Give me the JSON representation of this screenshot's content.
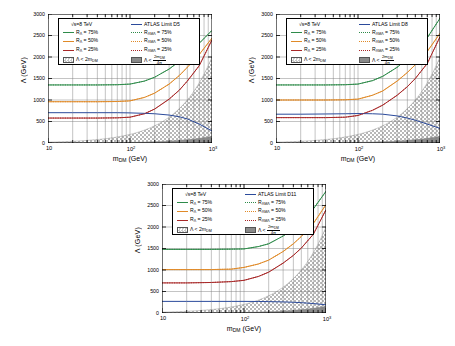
{
  "figure": {
    "axis": {
      "ylabel": "Λ (GeV)",
      "xlabel_main": "m",
      "xlabel_sub": "DM",
      "xlabel_unit": " (GeV)",
      "yticks": [
        "0",
        "500",
        "1000",
        "1500",
        "2000",
        "2500",
        "3000"
      ],
      "ytick_values": [
        0,
        500,
        1000,
        1500,
        2000,
        2500,
        3000
      ],
      "xticks": [
        "10",
        "10",
        "10"
      ],
      "xtick_exponents": [
        "",
        "2",
        "3"
      ],
      "xtick_values": [
        10,
        100,
        1000
      ],
      "ylim": [
        0,
        3000
      ],
      "xlim": [
        10,
        1000
      ],
      "xscale": "log",
      "grid": true
    },
    "legend_common": {
      "energy": "√s=8 TeV",
      "rows": [
        {
          "left_label": "R",
          "left_sub": "Λ",
          "left_value": " = 75%",
          "left_color": "#2e8b4a",
          "left_style": "solid",
          "right_label": "R",
          "right_sub": "ΛMΛ",
          "right_value": " = 75%",
          "right_color": "#2e8b4a",
          "right_style": "dotted"
        },
        {
          "left_label": "R",
          "left_sub": "Λ",
          "left_value": " = 50%",
          "left_color": "#e08a28",
          "left_style": "solid",
          "right_label": "R",
          "right_sub": "ΛMΛ",
          "right_value": " = 50%",
          "right_color": "#e08a28",
          "right_style": "dotted"
        },
        {
          "left_label": "R",
          "left_sub": "Λ",
          "left_value": " = 25%",
          "left_color": "#a82828",
          "left_style": "solid",
          "right_label": "R",
          "right_sub": "ΛMΛ",
          "right_value": " = 25%",
          "right_color": "#a82828",
          "right_style": "dotted"
        }
      ],
      "hatch_light_label_pre": "Λ < 2m",
      "hatch_light_label_sub": "DM",
      "hatch_dark_label_pre": "Λ < ",
      "hatch_dark_num_pre": "2m",
      "hatch_dark_num_sub": "DM",
      "hatch_dark_den": "4π",
      "atlas_color": "#2b4a9b"
    },
    "colors": {
      "green": "#2e8b4a",
      "orange": "#e08a28",
      "red": "#a82828",
      "blue": "#2b4a9b",
      "hatch_light": "#b8b8b8",
      "hatch_dark": "#8a8a8a",
      "axis": "#000000",
      "grid": "#7a7a7a"
    },
    "panels": [
      {
        "id": "panel-d5",
        "atlas_label": "ATLAS Limit D5",
        "position": {
          "left": 18,
          "top": 8,
          "width": 200,
          "height": 165
        }
      },
      {
        "id": "panel-d8",
        "atlas_label": "ATLAS Limit D8",
        "position": {
          "left": 246,
          "top": 8,
          "width": 200,
          "height": 165
        }
      },
      {
        "id": "panel-d11",
        "atlas_label": "ATLAS Limit D11",
        "position": {
          "left": 132,
          "top": 178,
          "width": 200,
          "height": 165
        }
      }
    ]
  },
  "chart_data": [
    {
      "type": "line",
      "title": "ATLAS Limit D5",
      "subtitle": "√s=8 TeV",
      "xlabel": "m_DM (GeV)",
      "ylabel": "Λ (GeV)",
      "xscale": "log",
      "xlim": [
        10,
        1000
      ],
      "ylim": [
        0,
        3000
      ],
      "grid": true,
      "legend_position": "top-left-inside",
      "x": [
        10,
        20,
        40,
        70,
        100,
        150,
        200,
        300,
        400,
        500,
        700,
        1000
      ],
      "series": [
        {
          "name": "R_Λ = 75%",
          "color": "#2e8b4a",
          "style": "solid",
          "values": [
            1350,
            1350,
            1350,
            1355,
            1370,
            1440,
            1530,
            1720,
            1900,
            2060,
            2320,
            2620
          ]
        },
        {
          "name": "R_Λ = 50%",
          "color": "#e08a28",
          "style": "solid",
          "values": [
            960,
            960,
            960,
            965,
            980,
            1060,
            1160,
            1370,
            1570,
            1760,
            2060,
            2440
          ]
        },
        {
          "name": "R_Λ = 25%",
          "color": "#a82828",
          "style": "solid",
          "values": [
            580,
            580,
            580,
            585,
            600,
            680,
            790,
            1020,
            1230,
            1440,
            1800,
            2400
          ]
        },
        {
          "name": "ATLAS Limit D5",
          "color": "#2b4a9b",
          "style": "solid",
          "values": [
            705,
            705,
            705,
            705,
            700,
            690,
            680,
            650,
            610,
            560,
            440,
            280
          ]
        },
        {
          "name": "R_ΛMΛ = 75%",
          "color": "#2e8b4a",
          "style": "dotted",
          "values": [
            1350,
            1350,
            1350,
            1355,
            1370,
            1440,
            1530,
            1720,
            1900,
            2060,
            2320,
            2620
          ]
        },
        {
          "name": "R_ΛMΛ = 50%",
          "color": "#e08a28",
          "style": "dotted",
          "values": [
            960,
            960,
            960,
            965,
            980,
            1060,
            1160,
            1370,
            1570,
            1760,
            2060,
            2440
          ]
        },
        {
          "name": "R_ΛMΛ = 25%",
          "color": "#a82828",
          "style": "dotted",
          "values": [
            580,
            580,
            580,
            585,
            600,
            680,
            790,
            1020,
            1230,
            1440,
            1800,
            2400
          ]
        }
      ],
      "regions": [
        {
          "name": "Λ < 2m_DM",
          "fill": "checker-light",
          "x": [
            10,
            1000
          ],
          "y_upper": [
            20,
            2000
          ]
        },
        {
          "name": "Λ < 2m_DM/4π",
          "fill": "solid-gray",
          "x": [
            10,
            1000
          ],
          "y_upper": [
            2,
            160
          ]
        }
      ]
    },
    {
      "type": "line",
      "title": "ATLAS Limit D8",
      "subtitle": "√s=8 TeV",
      "xlabel": "m_DM (GeV)",
      "ylabel": "Λ (GeV)",
      "xscale": "log",
      "xlim": [
        10,
        1000
      ],
      "ylim": [
        0,
        3000
      ],
      "grid": true,
      "legend_position": "top-left-inside",
      "x": [
        10,
        20,
        40,
        70,
        100,
        150,
        200,
        300,
        400,
        500,
        700,
        1000
      ],
      "series": [
        {
          "name": "R_Λ = 75%",
          "color": "#2e8b4a",
          "style": "solid",
          "values": [
            1350,
            1350,
            1350,
            1355,
            1370,
            1450,
            1550,
            1760,
            1960,
            2130,
            2450,
            2900
          ]
        },
        {
          "name": "R_Λ = 50%",
          "color": "#e08a28",
          "style": "solid",
          "values": [
            1000,
            1000,
            1000,
            1005,
            1020,
            1110,
            1210,
            1440,
            1640,
            1820,
            2130,
            2550
          ]
        },
        {
          "name": "R_Λ = 25%",
          "color": "#a82828",
          "style": "solid",
          "values": [
            590,
            590,
            590,
            600,
            640,
            760,
            880,
            1110,
            1310,
            1500,
            1850,
            2470
          ]
        },
        {
          "name": "ATLAS Limit D8",
          "color": "#2b4a9b",
          "style": "solid",
          "values": [
            670,
            670,
            675,
            680,
            685,
            680,
            670,
            630,
            580,
            530,
            440,
            340
          ]
        },
        {
          "name": "R_ΛMΛ = 75%",
          "color": "#2e8b4a",
          "style": "dotted",
          "values": [
            1350,
            1350,
            1350,
            1355,
            1370,
            1450,
            1550,
            1760,
            1960,
            2130,
            2450,
            2900
          ]
        },
        {
          "name": "R_ΛMΛ = 50%",
          "color": "#e08a28",
          "style": "dotted",
          "values": [
            1000,
            1000,
            1000,
            1005,
            1020,
            1110,
            1210,
            1440,
            1640,
            1820,
            2130,
            2550
          ]
        },
        {
          "name": "R_ΛMΛ = 25%",
          "color": "#a82828",
          "style": "dotted",
          "values": [
            590,
            590,
            590,
            600,
            640,
            760,
            880,
            1110,
            1310,
            1500,
            1850,
            2470
          ]
        }
      ],
      "regions": [
        {
          "name": "Λ < 2m_DM",
          "fill": "checker-light",
          "x": [
            10,
            1000
          ],
          "y_upper": [
            20,
            2000
          ]
        },
        {
          "name": "Λ < 2m_DM/4π",
          "fill": "solid-gray",
          "x": [
            10,
            1000
          ],
          "y_upper": [
            2,
            160
          ]
        }
      ]
    },
    {
      "type": "line",
      "title": "ATLAS Limit D11",
      "subtitle": "√s=8 TeV",
      "xlabel": "m_DM (GeV)",
      "ylabel": "Λ (GeV)",
      "xscale": "log",
      "xlim": [
        10,
        1000
      ],
      "ylim": [
        0,
        3000
      ],
      "grid": true,
      "legend_position": "top-left-inside",
      "x": [
        10,
        20,
        40,
        70,
        100,
        150,
        200,
        300,
        400,
        500,
        700,
        1000
      ],
      "series": [
        {
          "name": "R_Λ = 75%",
          "color": "#2e8b4a",
          "style": "solid",
          "values": [
            1480,
            1480,
            1480,
            1485,
            1490,
            1545,
            1610,
            1790,
            1960,
            2120,
            2420,
            2830
          ]
        },
        {
          "name": "R_Λ = 50%",
          "color": "#e08a28",
          "style": "solid",
          "values": [
            1010,
            1010,
            1010,
            1020,
            1060,
            1140,
            1230,
            1430,
            1610,
            1780,
            2080,
            2520
          ]
        },
        {
          "name": "R_Λ = 25%",
          "color": "#a82828",
          "style": "solid",
          "values": [
            700,
            700,
            710,
            730,
            760,
            850,
            950,
            1160,
            1340,
            1510,
            1830,
            2400
          ]
        },
        {
          "name": "ATLAS Limit D11",
          "color": "#2b4a9b",
          "style": "solid",
          "values": [
            270,
            270,
            270,
            270,
            270,
            268,
            265,
            258,
            250,
            240,
            220,
            190
          ]
        },
        {
          "name": "R_ΛMΛ = 75%",
          "color": "#2e8b4a",
          "style": "dotted",
          "values": [
            1480,
            1480,
            1480,
            1485,
            1490,
            1545,
            1610,
            1790,
            1960,
            2120,
            2420,
            2830
          ]
        },
        {
          "name": "R_ΛMΛ = 50%",
          "color": "#e08a28",
          "style": "dotted",
          "values": [
            1010,
            1010,
            1010,
            1020,
            1060,
            1140,
            1230,
            1430,
            1610,
            1780,
            2080,
            2520
          ]
        },
        {
          "name": "R_ΛMΛ = 25%",
          "color": "#a82828",
          "style": "dotted",
          "values": [
            700,
            700,
            710,
            730,
            760,
            850,
            950,
            1160,
            1340,
            1510,
            1830,
            2400
          ]
        }
      ],
      "regions": [
        {
          "name": "Λ < 2m_DM",
          "fill": "checker-light",
          "x": [
            10,
            1000
          ],
          "y_upper": [
            20,
            2000
          ]
        },
        {
          "name": "Λ < 2m_DM/4π",
          "fill": "solid-gray",
          "x": [
            10,
            1000
          ],
          "y_upper": [
            2,
            160
          ]
        }
      ]
    }
  ]
}
